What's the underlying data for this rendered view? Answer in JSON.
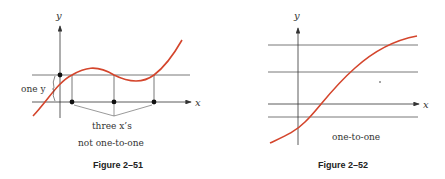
{
  "colors": {
    "curve": "#d4452c",
    "axis": "#333333",
    "line": "#555555",
    "text": "#333333"
  },
  "figures": [
    {
      "caption": "Figure 2–51",
      "y_axis_label": "y",
      "x_axis_label": "x",
      "annotation_one_y": "one y",
      "annotation_three_x": "three x’s",
      "subtitle": "not one-to-one"
    },
    {
      "caption": "Figure 2–52",
      "y_axis_label": "y",
      "x_axis_label": "x",
      "subtitle": "one-to-one"
    }
  ]
}
